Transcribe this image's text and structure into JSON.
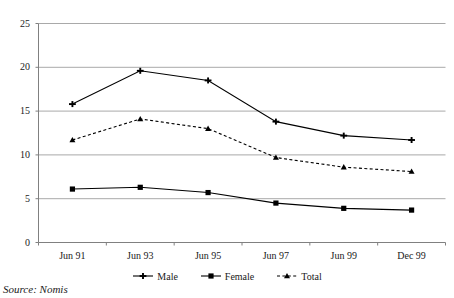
{
  "chart_data": {
    "type": "line",
    "title": "",
    "xlabel": "",
    "ylabel": "",
    "categories": [
      "Jun 91",
      "Jun 93",
      "Jun 95",
      "Jun 97",
      "Jun 99",
      "Dec 99"
    ],
    "series": [
      {
        "name": "Male",
        "values": [
          15.8,
          19.6,
          18.5,
          13.8,
          12.2,
          11.7
        ],
        "line_style": "solid",
        "marker": "cross",
        "color": "#000000"
      },
      {
        "name": "Female",
        "values": [
          6.1,
          6.3,
          5.7,
          4.5,
          3.9,
          3.7
        ],
        "line_style": "solid",
        "marker": "square",
        "color": "#000000"
      },
      {
        "name": "Total",
        "values": [
          11.7,
          14.1,
          13.0,
          9.7,
          8.6,
          8.1
        ],
        "line_style": "dashed",
        "marker": "triangle",
        "color": "#000000"
      }
    ],
    "ylim": [
      0,
      25
    ],
    "yticks": [
      "0",
      "5",
      "10",
      "15",
      "20",
      "25"
    ],
    "ytick_values": [
      0,
      5,
      10,
      15,
      20,
      25
    ],
    "grid": "horizontal",
    "legend_position": "bottom"
  },
  "caption": {
    "source": "Source: Nomis"
  },
  "colors": {
    "ink": "#000000",
    "gridline": "#a9a9a9",
    "axis": "#808080",
    "background": "#ffffff"
  }
}
